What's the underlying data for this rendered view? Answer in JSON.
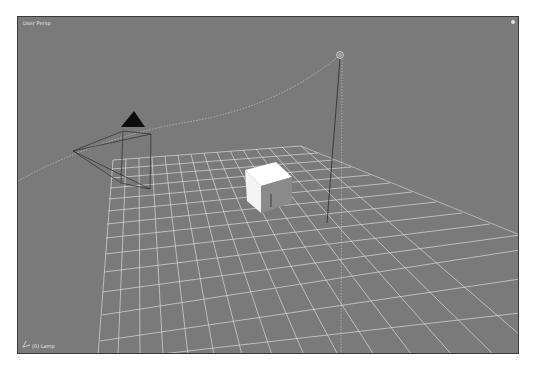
{
  "viewport": {
    "view_label": "User Persp",
    "active_object_label": "(0) Lamp",
    "background_color": "#7a7a7a",
    "grid_color": "#d8d8d8"
  },
  "scene": {
    "objects": [
      {
        "name": "Camera",
        "type": "camera"
      },
      {
        "name": "Cube",
        "type": "mesh"
      },
      {
        "name": "Plane",
        "type": "grid-plane"
      },
      {
        "name": "Lamp",
        "type": "lamp"
      }
    ]
  }
}
